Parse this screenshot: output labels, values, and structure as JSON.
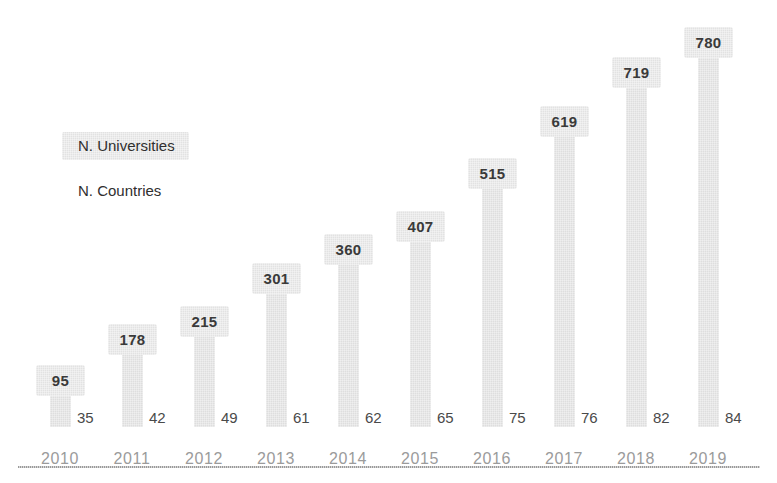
{
  "chart_data": {
    "type": "bar",
    "title": "",
    "xlabel": "",
    "ylabel": "",
    "grid": false,
    "legend_position": "upper-left-inside",
    "categories": [
      "2010",
      "2011",
      "2012",
      "2013",
      "2014",
      "2015",
      "2016",
      "2017",
      "2018",
      "2019"
    ],
    "ylim": [
      0,
      820
    ],
    "series": [
      {
        "name": "N. Universities",
        "render": "bar",
        "values": [
          95,
          178,
          215,
          301,
          360,
          407,
          515,
          619,
          719,
          780
        ]
      },
      {
        "name": "N. Countries",
        "render": "data-label-only",
        "values": [
          35,
          42,
          49,
          61,
          62,
          65,
          75,
          76,
          82,
          84
        ]
      }
    ]
  },
  "legend": {
    "universities": "N. Universities",
    "countries": "N. Countries"
  },
  "bars": [
    {
      "year": "2010",
      "universities": "95",
      "countries": "35"
    },
    {
      "year": "2011",
      "universities": "178",
      "countries": "42"
    },
    {
      "year": "2012",
      "universities": "215",
      "countries": "49"
    },
    {
      "year": "2013",
      "universities": "301",
      "countries": "61"
    },
    {
      "year": "2014",
      "universities": "360",
      "countries": "62"
    },
    {
      "year": "2015",
      "universities": "407",
      "countries": "65"
    },
    {
      "year": "2016",
      "universities": "515",
      "countries": "75"
    },
    {
      "year": "2017",
      "universities": "619",
      "countries": "76"
    },
    {
      "year": "2018",
      "universities": "719",
      "countries": "82"
    },
    {
      "year": "2019",
      "universities": "780",
      "countries": "84"
    }
  ],
  "colors": {
    "bar_fill": "#dedede",
    "label_box": "#e2e2e2",
    "label_text": "#3a3a3a",
    "tick_text": "#9b9b9b",
    "axis_rule": "#b0b0b0",
    "background": "#ffffff"
  }
}
